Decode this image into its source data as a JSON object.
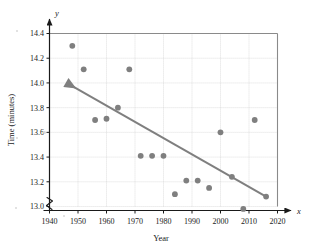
{
  "chart_data": {
    "type": "scatter",
    "title": "",
    "xlabel": "Year",
    "ylabel": "Time (minutes)",
    "x_axis_symbol": "x",
    "y_axis_symbol": "y",
    "xlim": [
      1940,
      2020
    ],
    "ylim": [
      13.0,
      14.4
    ],
    "xticks": [
      1940,
      1950,
      1960,
      1970,
      1980,
      1990,
      2000,
      2010,
      2020
    ],
    "yticks": [
      13.0,
      13.2,
      13.4,
      13.6,
      13.8,
      14.0,
      14.2,
      14.4
    ],
    "xtick_labels": [
      "1940",
      "1950",
      "1960",
      "1970",
      "1980",
      "1990",
      "2000",
      "2010",
      "2020"
    ],
    "ytick_labels": [
      "13.0",
      "13.2",
      "13.4",
      "13.6",
      "13.8",
      "14.0",
      "14.2",
      "14.4"
    ],
    "grid": true,
    "legend": "none",
    "axis_break": true,
    "marker_color": "#7f7f7f",
    "line_color": "#7f7f7f",
    "grid_color": "#cccccc",
    "frame_color": "#8a8a8a",
    "points": [
      {
        "x": 1948,
        "y": 14.3
      },
      {
        "x": 1952,
        "y": 14.11
      },
      {
        "x": 1956,
        "y": 13.7
      },
      {
        "x": 1960,
        "y": 13.71
      },
      {
        "x": 1964,
        "y": 13.8
      },
      {
        "x": 1968,
        "y": 14.11
      },
      {
        "x": 1972,
        "y": 13.41
      },
      {
        "x": 1976,
        "y": 13.41
      },
      {
        "x": 1980,
        "y": 13.41
      },
      {
        "x": 1984,
        "y": 13.1
      },
      {
        "x": 1988,
        "y": 13.21
      },
      {
        "x": 1992,
        "y": 13.21
      },
      {
        "x": 1996,
        "y": 13.15
      },
      {
        "x": 2000,
        "y": 13.6
      },
      {
        "x": 2004,
        "y": 13.24
      },
      {
        "x": 2008,
        "y": 12.98
      },
      {
        "x": 2012,
        "y": 13.7
      },
      {
        "x": 2016,
        "y": 13.08
      }
    ],
    "trendline": {
      "name": "fitted trend line",
      "x_start": 1946,
      "y_start": 14.0,
      "x_end": 2016,
      "y_end": 13.08,
      "arrow_at": "start"
    }
  }
}
